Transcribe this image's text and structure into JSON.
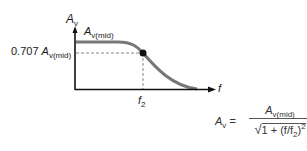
{
  "diagram": {
    "y_axis_label_main": "A",
    "y_axis_label_sub": "v",
    "x_axis_label": "f",
    "midband_label_main": "A",
    "midband_label_sub": "v(mid)",
    "cutoff_level_prefix": "0.707 ",
    "cutoff_level_main": "A",
    "cutoff_level_sub": "v(mid)",
    "cutoff_freq_main": "f",
    "cutoff_freq_sub": "2",
    "colors": {
      "axis": "#111111",
      "curve": "#777777",
      "dashed": "#888888",
      "point": "#111111"
    }
  },
  "equation": {
    "lhs_main": "A",
    "lhs_sub": "v",
    "equals": " =",
    "numerator_main": "A",
    "numerator_sub": "v(mid)",
    "denominator_radical": "√",
    "denominator_text": "1 + (f/f",
    "denominator_sub": "2",
    "denominator_close": ")",
    "denominator_power": "2"
  }
}
